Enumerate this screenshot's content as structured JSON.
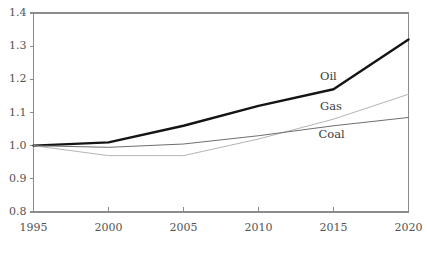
{
  "chart_data": {
    "type": "line",
    "title": "",
    "subtitle": "",
    "xlabel": "",
    "ylabel": "",
    "x": [
      1995,
      2000,
      2005,
      2010,
      2015,
      2020
    ],
    "xtick_labels": [
      "1995",
      "2000",
      "2005",
      "2010",
      "2015",
      "2020"
    ],
    "ytick_labels": [
      "0.8",
      "0.9",
      "1.0",
      "1.1",
      "1.2",
      "1.3",
      "1.4"
    ],
    "ytick_values": [
      0.8,
      0.9,
      1.0,
      1.1,
      1.2,
      1.3,
      1.4
    ],
    "xlim": [
      1995,
      2020
    ],
    "ylim": [
      0.8,
      1.4
    ],
    "grid": false,
    "legend_position": "inline-annotation",
    "series": [
      {
        "name": "Oil",
        "color": "#141414",
        "line_width": 2.4,
        "values": [
          1.0,
          1.01,
          1.06,
          1.12,
          1.17,
          1.32
        ],
        "label_x": 2014.1,
        "label_y": 1.208
      },
      {
        "name": "Gas",
        "color": "#b4b4b4",
        "line_width": 1.0,
        "values": [
          1.0,
          0.97,
          0.97,
          1.02,
          1.08,
          1.155
        ],
        "label_x": 2014.1,
        "label_y": 1.117
      },
      {
        "name": "Coal",
        "color": "#6e6e6e",
        "line_width": 1.0,
        "values": [
          1.0,
          0.995,
          1.005,
          1.03,
          1.06,
          1.085
        ],
        "label_x": 2014.0,
        "label_y": 1.032
      }
    ],
    "annotations": [
      "Oil",
      "Gas",
      "Coal"
    ],
    "axis_color": "#8c8c8c",
    "tick_label_color": "#545454"
  },
  "axes": {
    "y_axis_name": "value-axis",
    "x_axis_name": "year-axis"
  }
}
